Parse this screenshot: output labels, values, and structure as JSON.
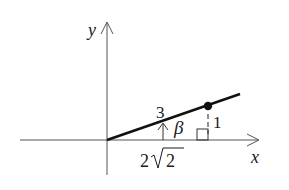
{
  "diagram": {
    "type": "trigonometry-right-triangle",
    "axes": {
      "x_label": "x",
      "y_label": "y"
    },
    "labels": {
      "hypotenuse": "3",
      "opposite": "1",
      "adjacent_coef": "2",
      "adjacent_radicand": "2",
      "angle": "β"
    },
    "colors": {
      "ink": "#1a1a1a",
      "axis": "#555555",
      "background": "#ffffff"
    }
  }
}
